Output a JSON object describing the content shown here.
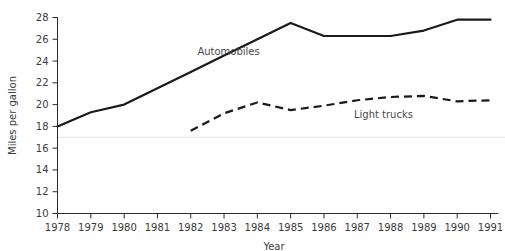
{
  "chart_data": {
    "type": "line",
    "title": "",
    "xlabel": "Year",
    "ylabel": "Miles per gallon",
    "x": [
      1978,
      1979,
      1980,
      1981,
      1982,
      1983,
      1984,
      1985,
      1986,
      1987,
      1988,
      1989,
      1990,
      1991
    ],
    "categories": [
      "1978",
      "1979",
      "1980",
      "1981",
      "1982",
      "1983",
      "1984",
      "1985",
      "1986",
      "1987",
      "1988",
      "1989",
      "1990",
      "1991"
    ],
    "xtick_labels": [
      "1978",
      "1979",
      "1980",
      "1981",
      "1982",
      "1983",
      "1984",
      "1985",
      "1986",
      "1987",
      "1988",
      "1989",
      "1990",
      "1991"
    ],
    "ytick_labels": [
      "10",
      "12",
      "14",
      "16",
      "18",
      "20",
      "22",
      "24",
      "26",
      "28"
    ],
    "yticks": [
      10,
      12,
      14,
      16,
      18,
      20,
      22,
      24,
      26,
      28
    ],
    "xlim": [
      1978,
      1991
    ],
    "ylim": [
      10,
      28
    ],
    "grid": false,
    "faint_reference_line_y": 17,
    "legend_position": "inline-annotations",
    "series": [
      {
        "name": "Automobiles",
        "style": "solid",
        "color": "#1a1a1a",
        "annotation_label": "Automobiles",
        "x": [
          1978,
          1979,
          1980,
          1981,
          1982,
          1983,
          1984,
          1985,
          1986,
          1987,
          1988,
          1989,
          1990,
          1991
        ],
        "values": [
          18.0,
          19.3,
          20.0,
          21.5,
          23.0,
          24.5,
          26.0,
          27.5,
          26.3,
          26.3,
          26.3,
          26.8,
          27.8,
          27.8
        ]
      },
      {
        "name": "Light trucks",
        "style": "dashed",
        "color": "#1a1a1a",
        "annotation_label": "Light trucks",
        "x": [
          1982,
          1983,
          1984,
          1985,
          1986,
          1987,
          1988,
          1989,
          1990,
          1991
        ],
        "values": [
          17.6,
          19.2,
          20.2,
          19.5,
          19.9,
          20.4,
          20.7,
          20.8,
          20.3,
          20.4
        ]
      }
    ],
    "annotations": [
      {
        "text": "Automobiles",
        "x": 1982.2,
        "y": 24.6
      },
      {
        "text": "Light trucks",
        "x": 1986.9,
        "y": 18.8
      }
    ]
  }
}
